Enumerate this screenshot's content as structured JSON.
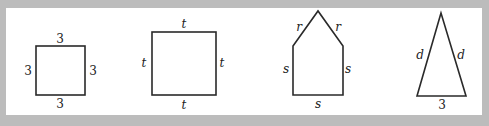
{
  "figures": [
    {
      "name": "square-3",
      "type": "square",
      "labels": {
        "top": "3",
        "left": "3",
        "right": "3",
        "bottom": "3"
      }
    },
    {
      "name": "square-t",
      "type": "square",
      "labels": {
        "top": "t",
        "left": "t",
        "right": "t",
        "bottom": "t"
      }
    },
    {
      "name": "pentagon",
      "type": "pentagon",
      "labels": {
        "roof_left": "r",
        "roof_right": "r",
        "left": "s",
        "right": "s",
        "bottom": "s"
      }
    },
    {
      "name": "triangle",
      "type": "isosceles-triangle",
      "labels": {
        "left": "d",
        "right": "d",
        "bottom": "3"
      }
    }
  ]
}
